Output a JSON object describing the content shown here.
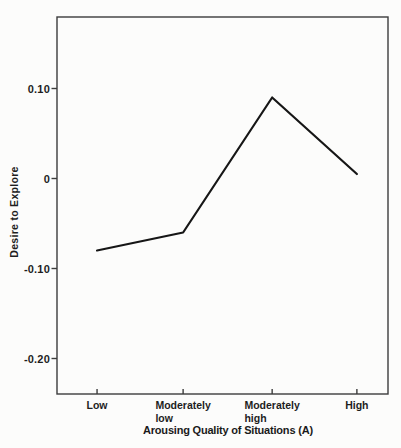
{
  "chart_data": {
    "type": "line",
    "categories": [
      "Low",
      "Moderately\nlow",
      "Moderately\nhigh",
      "High"
    ],
    "values": [
      -0.08,
      -0.06,
      0.09,
      0.005
    ],
    "title": "",
    "xlabel": "Arousing Quality of Situations (A)",
    "xlabel_main": "Arousing Quality of Situations",
    "xlabel_suffix": "(A)",
    "ylabel": "Desire to Explore",
    "ylim": [
      -0.26,
      0.18
    ],
    "yticks": [
      0.1,
      0,
      -0.1,
      -0.2
    ],
    "ytick_labels": [
      "0.10",
      "0",
      "-0.10",
      "-0.20"
    ],
    "grid": false,
    "legend": "none",
    "line_color": "#161616",
    "axis_color": "#3c3c3c",
    "background": "#fcfcfb"
  }
}
